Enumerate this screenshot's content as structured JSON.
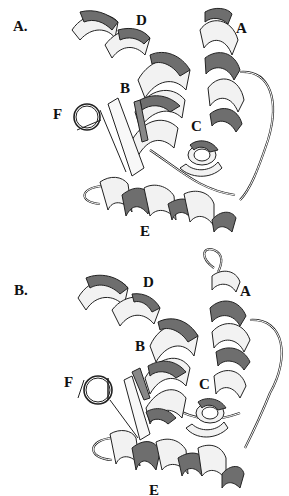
{
  "figure": {
    "panels": [
      {
        "label": "A.",
        "helix_labels": {
          "A": "A",
          "B": "B",
          "C": "C",
          "D": "D",
          "E": "E",
          "F": "F"
        }
      },
      {
        "label": "B.",
        "helix_labels": {
          "A": "A",
          "B": "B",
          "C": "C",
          "D": "D",
          "E": "E",
          "F": "F"
        }
      }
    ],
    "colors": {
      "ribbon_light": "#f2f2f2",
      "ribbon_dark": "#6e6e6e",
      "outline": "#222222",
      "background": "#ffffff"
    }
  }
}
